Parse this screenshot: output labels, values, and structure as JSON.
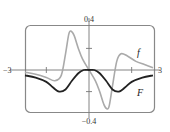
{
  "chart_data": {
    "type": "line",
    "title": "",
    "xlabel": "",
    "ylabel": "",
    "xlim": [
      -3,
      3
    ],
    "ylim": [
      -0.4,
      0.4
    ],
    "x_tick_labels": [
      "-3",
      "3"
    ],
    "y_tick_labels": [
      "0.4",
      "-0.4"
    ],
    "x_ticks": [
      -2,
      2
    ],
    "y_ticks": [
      0.2,
      -0.2
    ],
    "grid": false,
    "legend": "inline labels",
    "series": [
      {
        "name": "f",
        "color": "#aaaaaa",
        "x": [
          -3,
          -2.5,
          -2,
          -1.6,
          -1.3,
          -1.1,
          -0.95,
          -0.85,
          -0.7,
          -0.5,
          -0.3,
          0,
          0.3,
          0.5,
          0.7,
          0.85,
          0.95,
          1.1,
          1.3,
          1.5,
          1.8,
          2.2,
          2.6,
          3
        ],
        "values": [
          -0.02,
          -0.04,
          -0.07,
          -0.1,
          -0.05,
          0.15,
          0.33,
          0.36,
          0.32,
          0.2,
          0.1,
          0,
          -0.1,
          -0.2,
          -0.32,
          -0.36,
          -0.33,
          -0.15,
          0.08,
          0.15,
          0.13,
          0.08,
          0.05,
          0.02
        ]
      },
      {
        "name": "F",
        "color": "#222222",
        "x": [
          -3,
          -2.5,
          -2,
          -1.7,
          -1.4,
          -1.1,
          -0.8,
          -0.5,
          -0.25,
          0,
          0.25,
          0.5,
          0.8,
          1.1,
          1.4,
          1.7,
          2,
          2.5,
          3
        ],
        "values": [
          -0.05,
          -0.07,
          -0.11,
          -0.16,
          -0.2,
          -0.18,
          -0.1,
          -0.03,
          0,
          0,
          0,
          -0.03,
          -0.1,
          -0.18,
          -0.2,
          -0.16,
          -0.11,
          -0.07,
          -0.05
        ]
      }
    ],
    "annotations": [
      {
        "text": "f",
        "near_series": "f"
      },
      {
        "text": "F",
        "near_series": "F"
      }
    ]
  },
  "labels": {
    "y_top": "0.4",
    "y_bottom": "−0.4",
    "x_left": "−3",
    "x_right": "3",
    "f": "f",
    "F": "F"
  }
}
